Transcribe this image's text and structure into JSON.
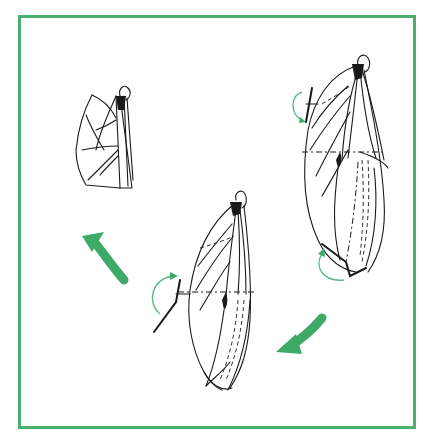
{
  "figure": {
    "type": "process-diagram",
    "frame_color": "#4caf6e",
    "arrow_color": "#3daa68",
    "stroke_color": "#1a1a1a",
    "stages": [
      {
        "id": "stage-1",
        "position": "right",
        "caption": ""
      },
      {
        "id": "stage-2",
        "position": "bottom-center",
        "caption": ""
      },
      {
        "id": "stage-3",
        "position": "top-left",
        "caption": ""
      }
    ],
    "flow_arrows": [
      {
        "from": "stage-1",
        "to": "stage-2",
        "direction": "down-left"
      },
      {
        "from": "stage-2",
        "to": "stage-3",
        "direction": "up-left"
      }
    ],
    "fold_indicators": [
      {
        "stage": "stage-1",
        "location": "upper-left",
        "type": "curved-fold-arrow"
      },
      {
        "stage": "stage-1",
        "location": "bottom",
        "type": "curved-fold-arrow"
      },
      {
        "stage": "stage-2",
        "location": "left",
        "type": "curved-fold-arrow"
      }
    ]
  }
}
